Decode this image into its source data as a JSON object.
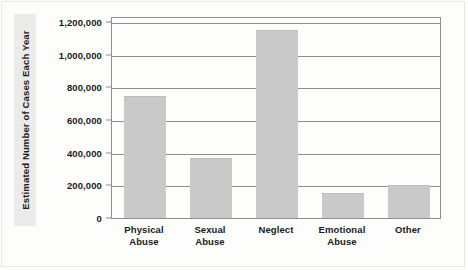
{
  "chart_data": {
    "type": "bar",
    "title": "",
    "subtitle": "",
    "xlabel": "",
    "ylabel": "Estimated Number of Cases Each Year",
    "categories": [
      "Physical Abuse",
      "Sexual Abuse",
      "Neglect",
      "Emotional Abuse",
      "Other"
    ],
    "category_lines": [
      [
        "Physical",
        "Abuse"
      ],
      [
        "Sexual",
        "Abuse"
      ],
      [
        "Neglect",
        ""
      ],
      [
        "Emotional",
        "Abuse"
      ],
      [
        "Other",
        ""
      ]
    ],
    "values": [
      750000,
      370000,
      1150000,
      155000,
      200000
    ],
    "ylim": [
      0,
      1200000
    ],
    "ytick_values": [
      0,
      200000,
      400000,
      600000,
      800000,
      1000000,
      1200000
    ],
    "ytick_labels": [
      "0",
      "200,000",
      "400,000",
      "600,000",
      "800,000",
      "1,000,000",
      "1,200,000"
    ],
    "grid": "horizontal",
    "legend": "none",
    "bar_color": "#c9c9c9",
    "axis_color": "#8e8e8e",
    "text_color": "#1a1a1a",
    "background_color": "#fdfdfc"
  }
}
